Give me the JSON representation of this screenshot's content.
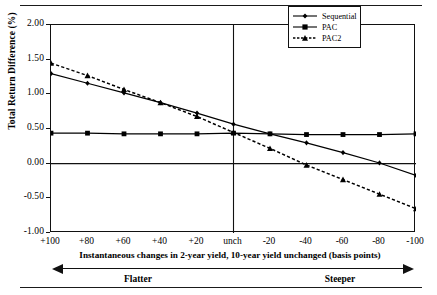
{
  "figure": {
    "yaxis_title": "Total Return Difference (%)",
    "xaxis_title": "Instantaneous changes in 2-year yield, 10-year yield unchanged (basis points)",
    "regime_left": "Flatter",
    "regime_right": "Steeper"
  },
  "legend": {
    "items": [
      {
        "label": "Sequential",
        "marker": "diamond",
        "style": "solid",
        "color": "#000000"
      },
      {
        "label": "PAC",
        "marker": "square",
        "style": "solid",
        "color": "#000000"
      },
      {
        "label": "PAC2",
        "marker": "triangle",
        "style": "dashed",
        "color": "#000000"
      }
    ]
  },
  "chart_data": {
    "type": "line",
    "title": "",
    "xlabel": "Instantaneous changes in 2-year yield, 10-year yield unchanged (basis points)",
    "ylabel": "Total Return Difference (%)",
    "x": [
      100,
      80,
      60,
      40,
      20,
      0,
      -20,
      -40,
      -60,
      -80,
      -100
    ],
    "x_tick_labels": [
      "+100",
      "+80",
      "+60",
      "+40",
      "+20",
      "unch",
      "-20",
      "-40",
      "-60",
      "-80",
      "-100"
    ],
    "y_tick_labels": [
      "2.00",
      "1.50",
      "1.00",
      "0.50",
      "0.00",
      "-0.50",
      "-1.00"
    ],
    "y_ticks": [
      2.0,
      1.5,
      1.0,
      0.5,
      0.0,
      -0.5,
      -1.0
    ],
    "xlim": [
      100,
      -100
    ],
    "ylim": [
      -1.0,
      2.0
    ],
    "grid": false,
    "legend_position": "top-right",
    "series": [
      {
        "name": "Sequential",
        "marker": "diamond",
        "style": "solid",
        "values": [
          1.3,
          1.16,
          1.02,
          0.88,
          0.73,
          0.57,
          0.43,
          0.3,
          0.16,
          0.01,
          -0.17
        ]
      },
      {
        "name": "PAC",
        "marker": "square",
        "style": "solid",
        "values": [
          0.44,
          0.44,
          0.43,
          0.43,
          0.43,
          0.44,
          0.43,
          0.42,
          0.42,
          0.42,
          0.43
        ]
      },
      {
        "name": "PAC2",
        "marker": "triangle",
        "style": "dashed",
        "values": [
          1.45,
          1.27,
          1.07,
          0.88,
          0.68,
          0.45,
          0.22,
          -0.02,
          -0.23,
          -0.44,
          -0.65
        ]
      }
    ],
    "annotations": [
      {
        "text": "unch",
        "note": "vertical reference line at 0 basis points"
      },
      {
        "text": "0.00",
        "note": "horizontal reference line at zero return difference"
      }
    ]
  }
}
